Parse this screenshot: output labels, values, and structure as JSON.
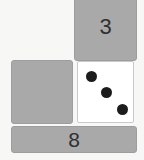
{
  "board": {
    "name": "domino-dice-board",
    "background_color": "#f7f7f5",
    "tile_color": "#a9a9a9",
    "tile_border_color": "#9d9d9d",
    "label_color": "#303030",
    "die_face_color": "#ffffff",
    "pip_color": "#1c1c1c"
  },
  "tiles": [
    {
      "id": "tile-three",
      "label": "3",
      "position": "top-right",
      "type": "number-tile"
    },
    {
      "id": "tile-blank",
      "label": "",
      "position": "middle-left",
      "type": "blank-tile"
    },
    {
      "id": "tile-eight",
      "label": "8",
      "position": "bottom",
      "type": "number-tile"
    }
  ],
  "die": {
    "id": "die-face",
    "value": "3",
    "pip_count": 3,
    "arrangement": "diagonal",
    "pips": [
      {
        "id": "pip-top-left",
        "label": "●"
      },
      {
        "id": "pip-center",
        "label": "●"
      },
      {
        "id": "pip-bottom-right",
        "label": "●"
      }
    ]
  }
}
